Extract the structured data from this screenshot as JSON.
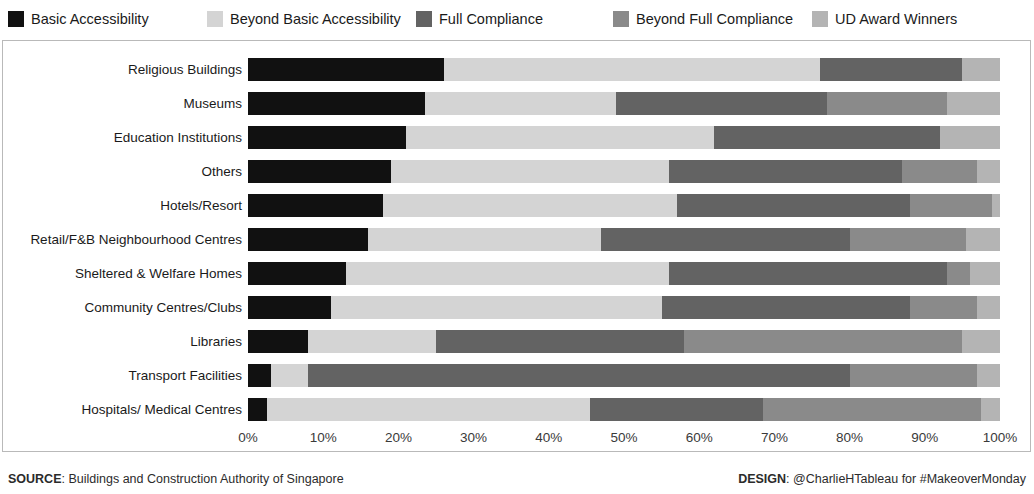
{
  "legend": {
    "position": "top",
    "items": [
      {
        "label": "Basic Accessibility",
        "color": "#111111",
        "x": 8
      },
      {
        "label": "Beyond Basic Accessibility",
        "color": "#d4d4d4",
        "x": 207
      },
      {
        "label": "Full Compliance",
        "color": "#636363",
        "x": 416
      },
      {
        "label": "Beyond Full Compliance",
        "color": "#8a8a8a",
        "x": 613
      },
      {
        "label": "UD Award Winners",
        "color": "#b4b4b4",
        "x": 812
      }
    ]
  },
  "footer": {
    "source_label": "SOURCE",
    "source_text": ": Buildings and Construction Authority of Singapore",
    "design_label": "DESIGN",
    "design_text": ": @CharlieHTableau for #MakeoverMonday"
  },
  "axis": {
    "ticks": [
      "0%",
      "10%",
      "20%",
      "30%",
      "40%",
      "50%",
      "60%",
      "70%",
      "80%",
      "90%",
      "100%"
    ]
  },
  "chart_data": {
    "type": "bar",
    "orientation": "horizontal",
    "stacked": true,
    "normalized": true,
    "title": "",
    "xlabel": "",
    "ylabel": "",
    "xlim": [
      0,
      100
    ],
    "grid": false,
    "legend_position": "top",
    "categories": [
      "Religious Buildings",
      "Museums",
      "Education Institutions",
      "Others",
      "Hotels/Resort",
      "Retail/F&B Neighbourhood Centres",
      "Sheltered & Welfare Homes",
      "Community Centres/Clubs",
      "Libraries",
      "Transport Facilities",
      "Hospitals/ Medical Centres"
    ],
    "series": [
      {
        "name": "Basic Accessibility",
        "color": "#111111",
        "values": [
          26.0,
          23.5,
          21.0,
          19.0,
          18.0,
          16.0,
          13.0,
          11.0,
          8.0,
          3.0,
          2.5
        ]
      },
      {
        "name": "Beyond Basic Accessibility",
        "color": "#d4d4d4",
        "values": [
          50.0,
          25.5,
          41.0,
          37.0,
          39.0,
          31.0,
          43.0,
          44.0,
          17.0,
          5.0,
          43.0
        ]
      },
      {
        "name": "Full Compliance",
        "color": "#636363",
        "values": [
          19.0,
          28.0,
          30.0,
          31.0,
          31.0,
          33.0,
          37.0,
          33.0,
          33.0,
          72.0,
          23.0
        ]
      },
      {
        "name": "Beyond Full Compliance",
        "color": "#8a8a8a",
        "values": [
          0.0,
          16.0,
          0.0,
          10.0,
          11.0,
          15.5,
          3.0,
          9.0,
          37.0,
          17.0,
          29.0
        ]
      },
      {
        "name": "UD Award Winners",
        "color": "#b4b4b4",
        "values": [
          5.0,
          7.0,
          8.0,
          3.0,
          1.0,
          4.5,
          4.0,
          3.0,
          5.0,
          3.0,
          2.5
        ]
      }
    ]
  }
}
